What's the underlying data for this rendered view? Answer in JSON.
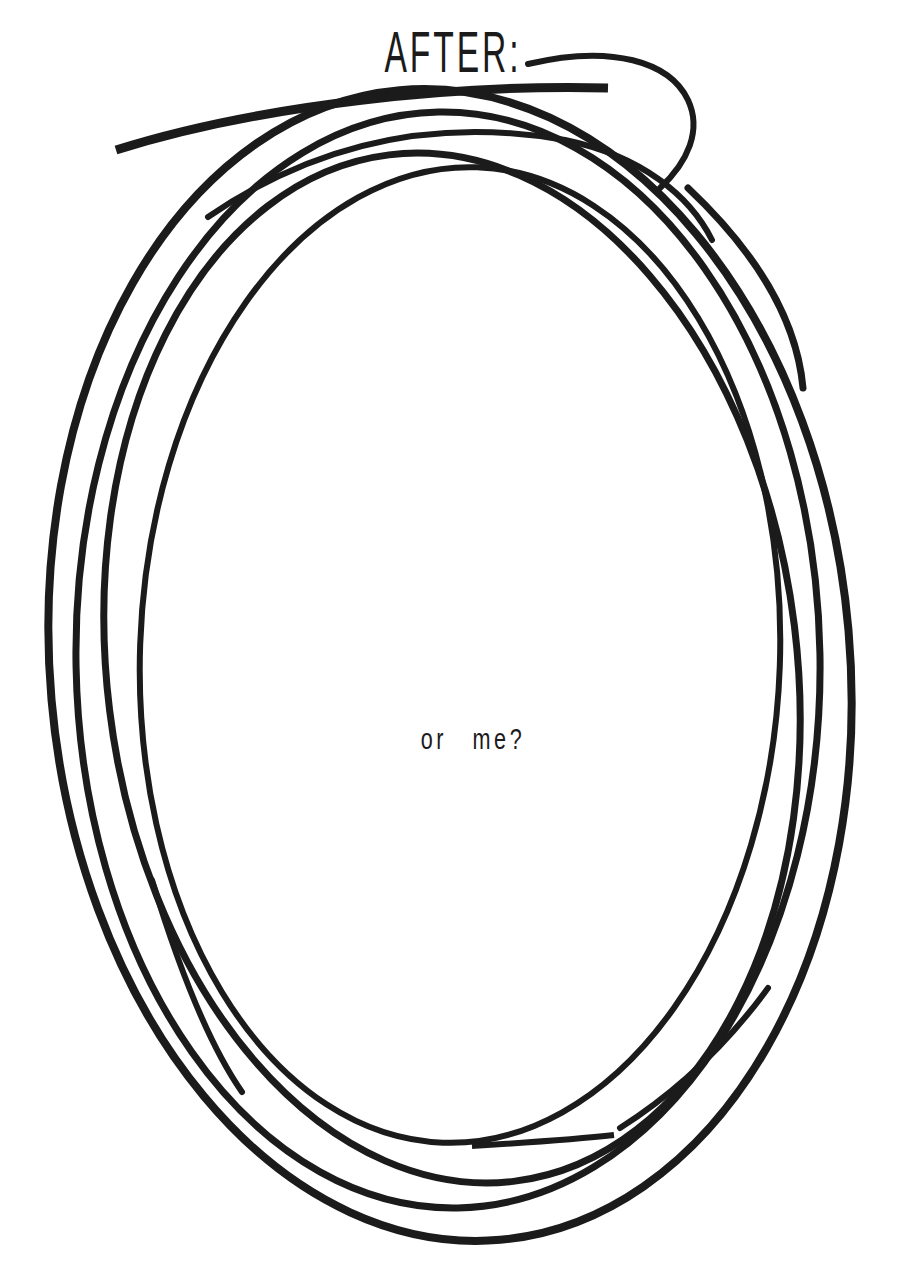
{
  "page": {
    "background_color": "#ffffff",
    "ink_color": "#1b1b1b"
  },
  "sketch": {
    "title": "AFTER:",
    "caption": "or me?",
    "figure": "hand-scribbled oval drawn with multiple overlapping pen loops"
  }
}
